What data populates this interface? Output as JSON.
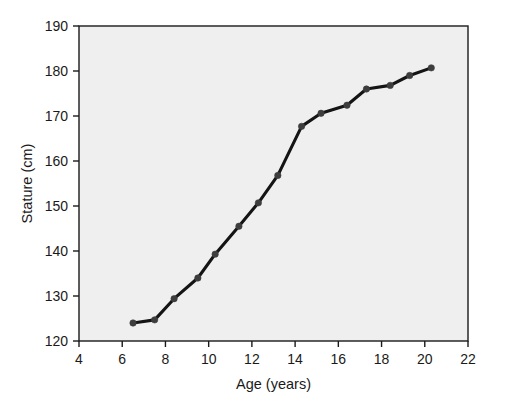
{
  "chart_data": {
    "type": "line",
    "title": "",
    "subtitle": "",
    "xlabel": "Age (years)",
    "ylabel": "Stature (cm)",
    "xlim": [
      4,
      22
    ],
    "ylim": [
      120,
      190
    ],
    "xticks": [
      4,
      6,
      8,
      10,
      12,
      14,
      16,
      18,
      20,
      22
    ],
    "xtick_labels": [
      "4",
      "6",
      "8",
      "10",
      "12",
      "14",
      "16",
      "18",
      "20",
      "22"
    ],
    "yticks": [
      120,
      130,
      140,
      150,
      160,
      170,
      180,
      190
    ],
    "ytick_labels": [
      "120",
      "130",
      "140",
      "150",
      "160",
      "170",
      "180",
      "190"
    ],
    "grid": false,
    "legend": null,
    "legend_position": "none",
    "annotations": [],
    "series": [
      {
        "name": "Stature",
        "marker": "circle",
        "color": "#141414",
        "x": [
          6.5,
          7.5,
          8.4,
          9.5,
          10.3,
          11.4,
          12.3,
          13.2,
          14.3,
          15.2,
          16.4,
          17.3,
          18.4,
          19.3,
          20.3
        ],
        "y": [
          124.0,
          124.7,
          129.4,
          134.0,
          139.3,
          145.5,
          150.7,
          156.8,
          167.7,
          170.6,
          172.4,
          176.0,
          176.8,
          179.0,
          180.7
        ],
        "points": [
          {
            "age": 6.5,
            "stature": 124.0
          },
          {
            "age": 7.5,
            "stature": 124.7
          },
          {
            "age": 8.4,
            "stature": 129.4
          },
          {
            "age": 9.5,
            "stature": 134.0
          },
          {
            "age": 10.3,
            "stature": 139.3
          },
          {
            "age": 11.4,
            "stature": 145.5
          },
          {
            "age": 12.3,
            "stature": 150.7
          },
          {
            "age": 13.2,
            "stature": 156.8
          },
          {
            "age": 14.3,
            "stature": 167.7
          },
          {
            "age": 15.2,
            "stature": 170.6
          },
          {
            "age": 16.4,
            "stature": 172.4
          },
          {
            "age": 17.3,
            "stature": 176.0
          },
          {
            "age": 18.4,
            "stature": 176.8
          },
          {
            "age": 19.3,
            "stature": 179.0
          },
          {
            "age": 20.3,
            "stature": 180.7
          }
        ]
      }
    ],
    "colors": {
      "line": "#141414",
      "marker": "#3d3d3d",
      "plot_background": "#efefef",
      "axis": "#1a1a1a",
      "page_background": "#ffffff"
    }
  }
}
